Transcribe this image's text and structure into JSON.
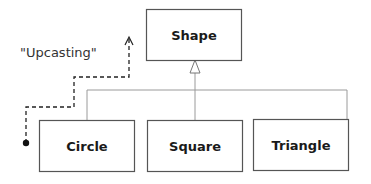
{
  "diagram": {
    "type": "uml-class-inheritance",
    "note": "\"Upcasting\"",
    "base_class": {
      "label": "Shape"
    },
    "derived_classes": [
      {
        "label": "Circle"
      },
      {
        "label": "Square"
      },
      {
        "label": "Triangle"
      }
    ],
    "colors": {
      "box_border": "#555555",
      "connector": "#999999",
      "dashed_path": "#222222",
      "text": "#1a1a1a"
    }
  }
}
